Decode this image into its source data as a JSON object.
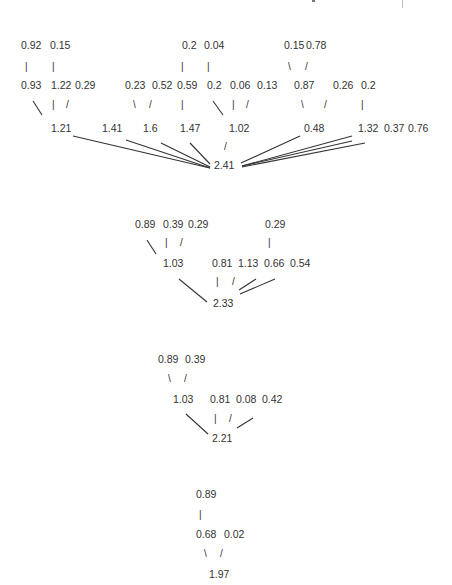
{
  "diagram": {
    "type": "tree-sum-diagrams",
    "color": "#333333",
    "trees": [
      {
        "id": "tree1",
        "root": "2.41",
        "nodes": [
          {
            "key": "n_092",
            "text": "0.92",
            "x": 21,
            "y": 39
          },
          {
            "key": "n_015a",
            "text": "0.15",
            "x": 50,
            "y": 39
          },
          {
            "key": "n_02a",
            "text": "0.2",
            "x": 182,
            "y": 39
          },
          {
            "key": "n_004",
            "text": "0.04",
            "x": 204,
            "y": 39
          },
          {
            "key": "n_015b",
            "text": "0.15",
            "x": 284,
            "y": 39
          },
          {
            "key": "n_078",
            "text": "0.78",
            "x": 306,
            "y": 39
          },
          {
            "key": "n_093",
            "text": "0.93",
            "x": 21,
            "y": 79
          },
          {
            "key": "n_122",
            "text": "1.22",
            "x": 51,
            "y": 79
          },
          {
            "key": "n_029",
            "text": "0.29",
            "x": 75,
            "y": 79
          },
          {
            "key": "n_023",
            "text": "0.23",
            "x": 125,
            "y": 79
          },
          {
            "key": "n_052",
            "text": "0.52",
            "x": 152,
            "y": 79
          },
          {
            "key": "n_059",
            "text": "0.59",
            "x": 177,
            "y": 79
          },
          {
            "key": "n_02b",
            "text": "0.2",
            "x": 207,
            "y": 79
          },
          {
            "key": "n_006",
            "text": "0.06",
            "x": 230,
            "y": 79
          },
          {
            "key": "n_013",
            "text": "0.13",
            "x": 257,
            "y": 79
          },
          {
            "key": "n_087",
            "text": "0.87",
            "x": 294,
            "y": 79
          },
          {
            "key": "n_026",
            "text": "0.26",
            "x": 333,
            "y": 79
          },
          {
            "key": "n_02c",
            "text": "0.2",
            "x": 361,
            "y": 79
          },
          {
            "key": "n_121",
            "text": "1.21",
            "x": 51,
            "y": 122
          },
          {
            "key": "n_141",
            "text": "1.41",
            "x": 102,
            "y": 122
          },
          {
            "key": "n_16",
            "text": "1.6",
            "x": 143,
            "y": 122
          },
          {
            "key": "n_147",
            "text": "1.47",
            "x": 180,
            "y": 122
          },
          {
            "key": "n_102",
            "text": "1.02",
            "x": 229,
            "y": 122
          },
          {
            "key": "n_048",
            "text": "0.48",
            "x": 304,
            "y": 122
          },
          {
            "key": "n_132",
            "text": "1.32",
            "x": 358,
            "y": 122
          },
          {
            "key": "n_037",
            "text": "0.37",
            "x": 384,
            "y": 122
          },
          {
            "key": "n_076",
            "text": "0.76",
            "x": 408,
            "y": 122
          },
          {
            "key": "n_241",
            "text": "2.41",
            "x": 214,
            "y": 159
          }
        ],
        "ticks": [
          {
            "glyph": "|",
            "x": 25,
            "y": 61
          },
          {
            "glyph": "|",
            "x": 52,
            "y": 61
          },
          {
            "glyph": "|",
            "x": 181,
            "y": 61
          },
          {
            "glyph": "|",
            "x": 207,
            "y": 61
          },
          {
            "glyph": "\\",
            "x": 288,
            "y": 61
          },
          {
            "glyph": "/",
            "x": 305,
            "y": 61
          },
          {
            "glyph": "|",
            "x": 52,
            "y": 99
          },
          {
            "glyph": "/",
            "x": 66,
            "y": 99
          },
          {
            "glyph": "\\",
            "x": 133,
            "y": 99
          },
          {
            "glyph": "/",
            "x": 149,
            "y": 99
          },
          {
            "glyph": "|",
            "x": 181,
            "y": 99
          },
          {
            "glyph": "|",
            "x": 232,
            "y": 99
          },
          {
            "glyph": "/",
            "x": 246,
            "y": 99
          },
          {
            "glyph": "\\",
            "x": 301,
            "y": 99
          },
          {
            "glyph": "/",
            "x": 324,
            "y": 99
          },
          {
            "glyph": "|",
            "x": 361,
            "y": 99
          },
          {
            "glyph": "/",
            "x": 224,
            "y": 141
          }
        ],
        "lines": [
          {
            "x1": 33,
            "y1": 101,
            "x2": 42,
            "y2": 115
          },
          {
            "x1": 213,
            "y1": 101,
            "x2": 223,
            "y2": 115
          },
          {
            "x1": 73,
            "y1": 136,
            "x2": 210,
            "y2": 168
          },
          {
            "x1": 126,
            "y1": 140,
            "x2": 210,
            "y2": 168
          },
          {
            "x1": 161,
            "y1": 143,
            "x2": 210,
            "y2": 167
          },
          {
            "x1": 190,
            "y1": 143,
            "x2": 210,
            "y2": 164
          },
          {
            "x1": 241,
            "y1": 163,
            "x2": 300,
            "y2": 136
          },
          {
            "x1": 242,
            "y1": 166,
            "x2": 352,
            "y2": 136
          },
          {
            "x1": 242,
            "y1": 166,
            "x2": 352,
            "y2": 141
          },
          {
            "x1": 242,
            "y1": 167,
            "x2": 365,
            "y2": 143
          }
        ]
      },
      {
        "id": "tree2",
        "root": "2.33",
        "nodes": [
          {
            "key": "n_089",
            "text": "0.89",
            "x": 135,
            "y": 218
          },
          {
            "key": "n_039",
            "text": "0.39",
            "x": 163,
            "y": 218
          },
          {
            "key": "n_029a",
            "text": "0.29",
            "x": 188,
            "y": 218
          },
          {
            "key": "n_029b",
            "text": "0.29",
            "x": 265,
            "y": 218
          },
          {
            "key": "n_103",
            "text": "1.03",
            "x": 163,
            "y": 257
          },
          {
            "key": "n_081",
            "text": "0.81",
            "x": 212,
            "y": 257
          },
          {
            "key": "n_113",
            "text": "1.13",
            "x": 238,
            "y": 257
          },
          {
            "key": "n_066",
            "text": "0.66",
            "x": 264,
            "y": 257
          },
          {
            "key": "n_054",
            "text": "0.54",
            "x": 290,
            "y": 257
          },
          {
            "key": "n_233",
            "text": "2.33",
            "x": 213,
            "y": 297
          }
        ],
        "ticks": [
          {
            "glyph": "|",
            "x": 165,
            "y": 237
          },
          {
            "glyph": "/",
            "x": 180,
            "y": 237
          },
          {
            "glyph": "|",
            "x": 268,
            "y": 237
          },
          {
            "glyph": "|",
            "x": 216,
            "y": 276
          },
          {
            "glyph": "/",
            "x": 232,
            "y": 276
          }
        ],
        "lines": [
          {
            "x1": 147,
            "y1": 240,
            "x2": 156,
            "y2": 254
          },
          {
            "x1": 179,
            "y1": 279,
            "x2": 207,
            "y2": 302
          },
          {
            "x1": 239,
            "y1": 290,
            "x2": 256,
            "y2": 279
          },
          {
            "x1": 240,
            "y1": 294,
            "x2": 275,
            "y2": 279
          }
        ]
      },
      {
        "id": "tree3",
        "root": "2.21",
        "nodes": [
          {
            "key": "n_089c",
            "text": "0.89",
            "x": 158,
            "y": 353
          },
          {
            "key": "n_039c",
            "text": "0.39",
            "x": 185,
            "y": 353
          },
          {
            "key": "n_103c",
            "text": "1.03",
            "x": 173,
            "y": 393
          },
          {
            "key": "n_081c",
            "text": "0.81",
            "x": 210,
            "y": 393
          },
          {
            "key": "n_008",
            "text": "0.08",
            "x": 236,
            "y": 393
          },
          {
            "key": "n_042",
            "text": "0.42",
            "x": 262,
            "y": 393
          },
          {
            "key": "n_221",
            "text": "2.21",
            "x": 212,
            "y": 432
          }
        ],
        "ticks": [
          {
            "glyph": "\\",
            "x": 168,
            "y": 373
          },
          {
            "glyph": "/",
            "x": 184,
            "y": 373
          },
          {
            "glyph": "|",
            "x": 214,
            "y": 413
          },
          {
            "glyph": "/",
            "x": 229,
            "y": 413
          }
        ],
        "lines": [
          {
            "x1": 186,
            "y1": 414,
            "x2": 208,
            "y2": 434
          },
          {
            "x1": 237,
            "y1": 428,
            "x2": 253,
            "y2": 418
          }
        ]
      },
      {
        "id": "tree4",
        "root": "1.97",
        "nodes": [
          {
            "key": "n_089d",
            "text": "0.89",
            "x": 196,
            "y": 488
          },
          {
            "key": "n_068",
            "text": "0.68",
            "x": 196,
            "y": 528
          },
          {
            "key": "n_002",
            "text": "0.02",
            "x": 224,
            "y": 528
          },
          {
            "key": "n_197",
            "text": "1.97",
            "x": 209,
            "y": 568
          }
        ],
        "ticks": [
          {
            "glyph": "|",
            "x": 199,
            "y": 509
          },
          {
            "glyph": "\\",
            "x": 204,
            "y": 548
          },
          {
            "glyph": "/",
            "x": 220,
            "y": 548
          }
        ],
        "lines": []
      }
    ]
  }
}
